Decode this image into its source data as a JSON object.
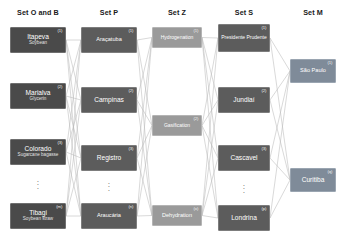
{
  "diagram": {
    "type": "supply-chain-network",
    "title": "",
    "columns": [
      {
        "id": "set-o-b",
        "header": "Set O and B",
        "x": 10,
        "node_class": "supply",
        "nodes": [
          {
            "title": "Itapeva",
            "sup": "(1)",
            "sub": "Soybean",
            "x": 10,
            "y": 27,
            "w": 56,
            "h": 26
          },
          {
            "title": "Marialva",
            "sup": "(2)",
            "sub": "Glycerin",
            "x": 10,
            "y": 83,
            "w": 56,
            "h": 26
          },
          {
            "title": "Colorado",
            "sup": "(3)",
            "sub": "Sugarcane bagasse",
            "x": 10,
            "y": 139,
            "w": 56,
            "h": 26
          },
          {
            "title": "Tibagi",
            "sup": "(m)",
            "sub": "Soybean straw",
            "x": 10,
            "y": 203,
            "w": 56,
            "h": 26
          }
        ],
        "ellipsis": {
          "x": 33,
          "y": 180
        }
      },
      {
        "id": "set-p",
        "header": "Set P",
        "x": 81,
        "node_class": "plant",
        "nodes": [
          {
            "title": "Araçatuba",
            "sup": "(1)",
            "sub": "",
            "x": 81,
            "y": 27,
            "w": 56,
            "h": 26
          },
          {
            "title": "Campinas",
            "sup": "(2)",
            "sub": "",
            "x": 81,
            "y": 87,
            "w": 56,
            "h": 26
          },
          {
            "title": "Registro",
            "sup": "(3)",
            "sub": "",
            "x": 81,
            "y": 145,
            "w": 56,
            "h": 26
          },
          {
            "title": "Araucária",
            "sup": "(n)",
            "sub": "",
            "x": 81,
            "y": 203,
            "w": 56,
            "h": 26
          }
        ],
        "ellipsis": {
          "x": 104,
          "y": 182
        }
      },
      {
        "id": "set-z",
        "header": "Set Z",
        "x": 152,
        "node_class": "process",
        "nodes": [
          {
            "title": "Hydrogenation",
            "sup": "(1)",
            "sub": "",
            "x": 152,
            "y": 27,
            "w": 50,
            "h": 21
          },
          {
            "title": "Gasification",
            "sup": "(2)",
            "sub": "",
            "x": 152,
            "y": 115,
            "w": 50,
            "h": 21
          },
          {
            "title": "Dehydration",
            "sup": "(o)",
            "sub": "",
            "x": 152,
            "y": 205,
            "w": 50,
            "h": 21
          }
        ],
        "ellipsis": null
      },
      {
        "id": "set-s",
        "header": "Set S",
        "x": 218,
        "node_class": "plant",
        "nodes": [
          {
            "title": "Presidente Prudente",
            "sup": "(1)",
            "sub": "",
            "x": 218,
            "y": 24,
            "w": 52,
            "h": 28
          },
          {
            "title": "Jundiaí",
            "sup": "(2)",
            "sub": "",
            "x": 218,
            "y": 87,
            "w": 52,
            "h": 26
          },
          {
            "title": "Cascavel",
            "sup": "(3)",
            "sub": "",
            "x": 218,
            "y": 145,
            "w": 52,
            "h": 26
          },
          {
            "title": "Londrina",
            "sup": "(p)",
            "sub": "",
            "x": 218,
            "y": 205,
            "w": 52,
            "h": 26
          }
        ],
        "ellipsis": {
          "x": 239,
          "y": 184
        }
      },
      {
        "id": "set-m",
        "header": "Set M",
        "x": 290,
        "node_class": "sink",
        "nodes": [
          {
            "title": "São Paulo",
            "sup": "(1)",
            "sub": "",
            "x": 290,
            "y": 59,
            "w": 46,
            "h": 24
          },
          {
            "title": "Curitiba",
            "sup": "(q)",
            "sub": "",
            "x": 290,
            "y": 168,
            "w": 46,
            "h": 24
          }
        ],
        "ellipsis": null
      }
    ],
    "colors": {
      "supply_node": "#4a4a4a",
      "plant_node": "#5c5c5c",
      "process_node": "#9a9a9a",
      "sink_node": "#7f8b99",
      "edge": "#b9b9b9",
      "background": "#ffffff",
      "header_text": "#1a1a1a",
      "node_text": "#ffffff"
    },
    "edges": {
      "description": "fully-connected bipartite links between adjacent column sets",
      "stroke_width": 0.55,
      "stages": [
        {
          "from": "set-o-b",
          "to": "set-p"
        },
        {
          "from": "set-p",
          "to": "set-z"
        },
        {
          "from": "set-z",
          "to": "set-s"
        },
        {
          "from": "set-s",
          "to": "set-m"
        }
      ]
    },
    "ellipsis_glyph": "·"
  }
}
